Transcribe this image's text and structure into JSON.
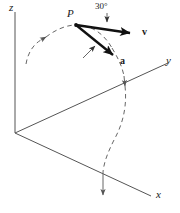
{
  "figure": {
    "background_color": "#ffffff",
    "line_color": "#555555",
    "vector_color": "#1a1a1a",
    "text_color": "#1a1a1a",
    "width": 180,
    "height": 213
  },
  "axes": {
    "origin": {
      "x": 15,
      "y": 133
    },
    "z": {
      "label": "z",
      "tip": {
        "x": 15,
        "y": 10
      },
      "label_pos": {
        "x": 9,
        "y": 2
      }
    },
    "y": {
      "label": "y",
      "tip": {
        "x": 170,
        "y": 62
      },
      "label_pos": {
        "x": 166,
        "y": 56
      }
    },
    "x": {
      "label": "x",
      "tip": {
        "x": 153,
        "y": 198
      },
      "label_pos": {
        "x": 155,
        "y": 190
      }
    }
  },
  "point": {
    "label": "P",
    "position": {
      "x": 76,
      "y": 25
    },
    "label_pos": {
      "x": 67,
      "y": 6
    }
  },
  "vectors": [
    {
      "name": "velocity",
      "label": "v",
      "from": {
        "x": 76,
        "y": 25
      },
      "to": {
        "x": 139,
        "y": 34
      },
      "label_pos": {
        "x": 142,
        "y": 29
      }
    },
    {
      "name": "acceleration",
      "label": "a",
      "from": {
        "x": 76,
        "y": 25
      },
      "to": {
        "x": 120,
        "y": 61
      },
      "label_pos": {
        "x": 122,
        "y": 59
      }
    }
  ],
  "angle": {
    "label": "30°",
    "value": 30,
    "unit": "degrees",
    "label_pos": {
      "x": 97,
      "y": 3
    },
    "leader_from": {
      "x": 107,
      "y": 14
    },
    "leader_to": {
      "x": 107,
      "y": 25
    },
    "indicator_from": {
      "x": 84,
      "y": 57
    },
    "indicator_to": {
      "x": 97,
      "y": 45
    }
  },
  "trajectory": {
    "style": "dashed",
    "description": "curved path through P with direction arrows"
  }
}
